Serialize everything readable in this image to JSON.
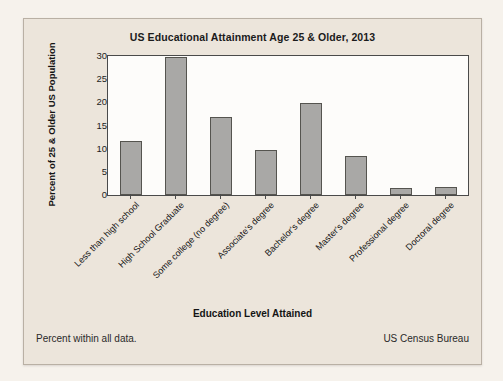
{
  "card": {
    "footer_note": "Percent within all data.",
    "source": "US Census Bureau"
  },
  "chart_data": {
    "type": "bar",
    "title": "US Educational Attainment Age 25 & Older, 2013",
    "xlabel": "Education Level Attained",
    "ylabel": "Percent of 25 & Older US Population",
    "ylim": [
      0,
      30
    ],
    "yticks": [
      0,
      5,
      10,
      15,
      20,
      25,
      30
    ],
    "grid": false,
    "legend": null,
    "bar_color": "#a9a8a6",
    "bar_border_color": "#55544f",
    "plot_background": "#fdfcfa",
    "card_background": "#ece5db",
    "categories": [
      "Less than high school",
      "High School Graduate",
      "Some college (no degree)",
      "Associate's degree",
      "Bachelor's degree",
      "Master's degree",
      "Professional degree",
      "Doctoral degree"
    ],
    "values": [
      11.7,
      29.8,
      16.8,
      9.8,
      19.9,
      8.4,
      1.5,
      1.8
    ]
  }
}
